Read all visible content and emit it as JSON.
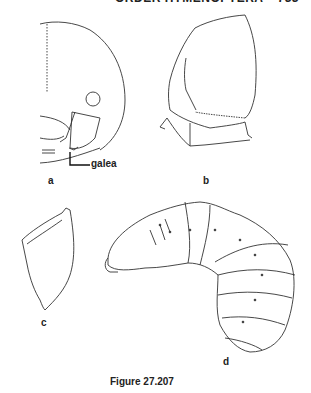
{
  "header": {
    "running_title": "ORDER HYMENOPTERA",
    "page_number": "733"
  },
  "figure": {
    "caption": "Figure 27.207",
    "panels": [
      {
        "id": "a",
        "label": "a",
        "callout": "galea"
      },
      {
        "id": "b",
        "label": "b"
      },
      {
        "id": "c",
        "label": "c"
      },
      {
        "id": "d",
        "label": "d"
      }
    ]
  }
}
